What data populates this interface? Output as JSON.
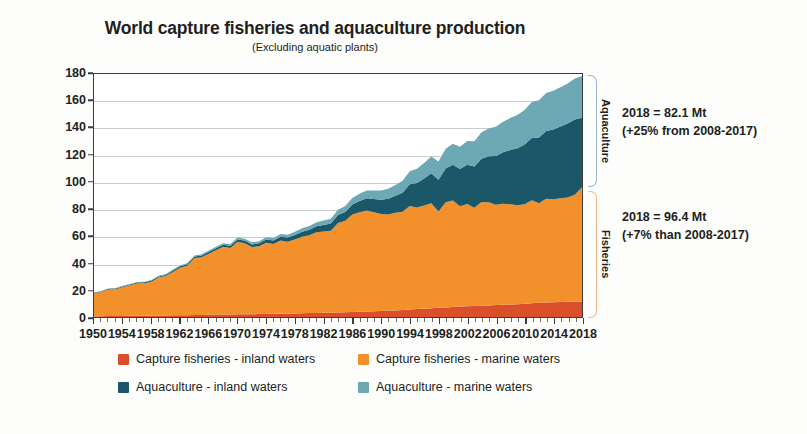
{
  "chart_data": {
    "type": "area",
    "stacked": true,
    "title": "World capture fisheries and aquaculture production",
    "subtitle": "(Excluding aquatic plants)",
    "xlabel": "",
    "ylabel": "Million tonnes",
    "ylim": [
      0,
      180
    ],
    "ytick_step": 20,
    "yticks": [
      0,
      20,
      40,
      60,
      80,
      100,
      120,
      140,
      160,
      180
    ],
    "xlim": [
      1950,
      2018
    ],
    "xticks": [
      1950,
      1954,
      1958,
      1962,
      1966,
      1970,
      1974,
      1978,
      1982,
      1986,
      1990,
      1994,
      1998,
      2002,
      2006,
      2010,
      2014,
      2018
    ],
    "grid": "horizontal",
    "legend_position": "bottom",
    "x": [
      1950,
      1951,
      1952,
      1953,
      1954,
      1955,
      1956,
      1957,
      1958,
      1959,
      1960,
      1961,
      1962,
      1963,
      1964,
      1965,
      1966,
      1967,
      1968,
      1969,
      1970,
      1971,
      1972,
      1973,
      1974,
      1975,
      1976,
      1977,
      1978,
      1979,
      1980,
      1981,
      1982,
      1983,
      1984,
      1985,
      1986,
      1987,
      1988,
      1989,
      1990,
      1991,
      1992,
      1993,
      1994,
      1995,
      1996,
      1997,
      1998,
      1999,
      2000,
      2001,
      2002,
      2003,
      2004,
      2005,
      2006,
      2007,
      2008,
      2009,
      2010,
      2011,
      2012,
      2013,
      2014,
      2015,
      2016,
      2017,
      2018
    ],
    "series": [
      {
        "name": "Capture fisheries - inland waters",
        "color": "#D94F2B",
        "values": [
          1.2,
          1.3,
          1.4,
          1.4,
          1.5,
          1.6,
          1.6,
          1.7,
          1.8,
          1.8,
          1.9,
          2.0,
          2.1,
          2.1,
          2.2,
          2.3,
          2.4,
          2.5,
          2.5,
          2.6,
          2.7,
          2.7,
          2.8,
          2.9,
          3.0,
          3.1,
          3.2,
          3.3,
          3.4,
          3.5,
          3.6,
          3.7,
          3.8,
          3.9,
          4.0,
          4.2,
          4.4,
          4.6,
          4.8,
          5.0,
          5.2,
          5.4,
          5.6,
          5.9,
          6.2,
          6.6,
          6.9,
          7.2,
          7.5,
          7.8,
          8.1,
          8.4,
          8.6,
          8.8,
          9.0,
          9.3,
          9.5,
          9.7,
          10.0,
          10.2,
          10.5,
          10.8,
          11.2,
          11.4,
          11.6,
          11.8,
          11.9,
          12.0,
          12.0
        ]
      },
      {
        "name": "Capture fisheries - marine waters",
        "color": "#F2912B",
        "values": [
          16.8,
          18.0,
          19.6,
          19.8,
          21.2,
          22.5,
          23.8,
          23.9,
          25.0,
          28.0,
          29.0,
          32.0,
          35.0,
          36.5,
          42.0,
          42.5,
          45.0,
          47.5,
          50.0,
          49.0,
          53.5,
          52.5,
          49.5,
          50.0,
          52.5,
          51.5,
          54.0,
          53.0,
          54.5,
          56.5,
          57.5,
          59.5,
          60.0,
          60.5,
          66.0,
          67.5,
          72.0,
          73.5,
          74.5,
          73.0,
          71.5,
          71.0,
          72.0,
          72.5,
          76.5,
          75.0,
          76.0,
          77.5,
          71.0,
          77.5,
          78.5,
          74.0,
          75.5,
          72.5,
          76.5,
          76.0,
          74.0,
          74.5,
          74.0,
          73.0,
          73.5,
          76.0,
          73.5,
          76.5,
          76.0,
          76.5,
          77.0,
          79.0,
          84.4
        ]
      },
      {
        "name": "Aquaculture - inland waters",
        "color": "#1A5769",
        "values": [
          0.4,
          0.4,
          0.5,
          0.5,
          0.6,
          0.6,
          0.7,
          0.7,
          0.8,
          0.8,
          0.9,
          1.0,
          1.0,
          1.1,
          1.2,
          1.3,
          1.4,
          1.5,
          1.6,
          1.7,
          1.8,
          1.9,
          2.0,
          2.2,
          2.4,
          2.6,
          2.8,
          3.0,
          3.3,
          3.6,
          4.0,
          4.4,
          4.8,
          5.3,
          5.9,
          6.5,
          7.3,
          8.2,
          9.0,
          9.8,
          10.5,
          11.5,
          12.5,
          14.0,
          16.0,
          18.0,
          20.0,
          22.0,
          23.5,
          25.0,
          26.5,
          27.5,
          29.0,
          30.5,
          32.0,
          34.0,
          36.0,
          38.0,
          40.0,
          42.0,
          44.0,
          46.0,
          48.5,
          50.0,
          51.5,
          53.0,
          54.5,
          55.5,
          51.3
        ]
      },
      {
        "name": "Aquaculture - marine waters",
        "color": "#6DA8B5",
        "values": [
          0.3,
          0.3,
          0.3,
          0.4,
          0.4,
          0.4,
          0.5,
          0.5,
          0.5,
          0.6,
          0.6,
          0.7,
          0.7,
          0.8,
          0.8,
          0.9,
          1.0,
          1.0,
          1.1,
          1.2,
          1.3,
          1.4,
          1.5,
          1.6,
          1.7,
          1.9,
          2.0,
          2.2,
          2.4,
          2.6,
          2.8,
          3.0,
          3.3,
          3.6,
          4.0,
          4.4,
          4.8,
          5.3,
          5.8,
          6.3,
          6.8,
          7.4,
          8.0,
          8.8,
          9.6,
          10.5,
          11.5,
          12.5,
          13.5,
          14.5,
          15.5,
          16.5,
          17.5,
          18.5,
          19.5,
          20.5,
          21.5,
          22.5,
          23.5,
          24.5,
          25.5,
          26.5,
          27.5,
          28.0,
          28.5,
          29.0,
          29.5,
          30.2,
          30.8
        ]
      }
    ],
    "totals_2018": {
      "aquaculture": 82.1,
      "fisheries": 96.4,
      "all": 178.5
    },
    "annotations": [
      {
        "group": "Aquaculture",
        "line1": "2018 = 82.1 Mt",
        "line2": "(+25% from 2008-2017)",
        "bracket_color": "#9fb6cf"
      },
      {
        "group": "Fisheries",
        "line1": "2018 = 96.4 Mt",
        "line2": "(+7% than 2008-2017)",
        "bracket_color": "#f0b98a"
      }
    ]
  },
  "legend": {
    "items": [
      {
        "label": "Capture fisheries - inland waters",
        "color": "#D94F2B"
      },
      {
        "label": "Capture fisheries - marine waters",
        "color": "#F2912B"
      },
      {
        "label": "Aquaculture - inland waters",
        "color": "#1A5769"
      },
      {
        "label": "Aquaculture - marine waters",
        "color": "#6DA8B5"
      }
    ]
  }
}
